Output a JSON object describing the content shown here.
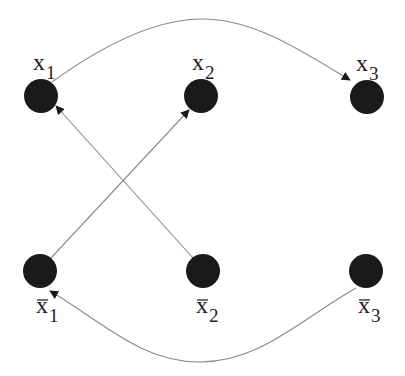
{
  "diagram": {
    "type": "directed-graph",
    "nodes": [
      {
        "id": "x1",
        "label": "x",
        "subscript": "1",
        "bar": false,
        "cx": 41,
        "cy": 96
      },
      {
        "id": "x2",
        "label": "x",
        "subscript": "2",
        "bar": false,
        "cx": 201,
        "cy": 96
      },
      {
        "id": "x3",
        "label": "x",
        "subscript": "3",
        "bar": false,
        "cx": 367,
        "cy": 97
      },
      {
        "id": "x1bar",
        "label": "x",
        "subscript": "1",
        "bar": true,
        "cx": 40,
        "cy": 271
      },
      {
        "id": "x2bar",
        "label": "x",
        "subscript": "2",
        "bar": true,
        "cx": 203,
        "cy": 271
      },
      {
        "id": "x3bar",
        "label": "x",
        "subscript": "3",
        "bar": true,
        "cx": 366,
        "cy": 271
      }
    ],
    "edges": [
      {
        "from": "x1",
        "to": "x3",
        "shape": "curve-over"
      },
      {
        "from": "x1bar",
        "to": "x2",
        "shape": "straight"
      },
      {
        "from": "x2bar",
        "to": "x1",
        "shape": "straight"
      },
      {
        "from": "x3bar",
        "to": "x1bar",
        "shape": "curve-under"
      }
    ],
    "colors": {
      "node": "#1a1a1a",
      "edge": "#8a8a8a",
      "background": "#ffffff"
    }
  },
  "labels": {
    "x1": {
      "base": "x",
      "sub": "1"
    },
    "x2": {
      "base": "x",
      "sub": "2"
    },
    "x3": {
      "base": "x",
      "sub": "3"
    },
    "x1bar": {
      "base": "x",
      "sub": "1"
    },
    "x2bar": {
      "base": "x",
      "sub": "2"
    },
    "x3bar": {
      "base": "x",
      "sub": "3"
    }
  }
}
